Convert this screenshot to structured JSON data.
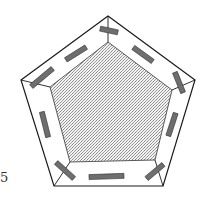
{
  "figure": {
    "label": "5",
    "outer_pentagon": "108,16 195,80 163,186 54,186 21,80",
    "inner_pentagon": "108,42 172,90 155,160 70,162 50,87",
    "colors": {
      "stroke": "#1a1a1a",
      "bar_fill": "#6e6e6e",
      "bar_stroke": "#333333",
      "inner_fill": "#d4d4d4"
    }
  }
}
